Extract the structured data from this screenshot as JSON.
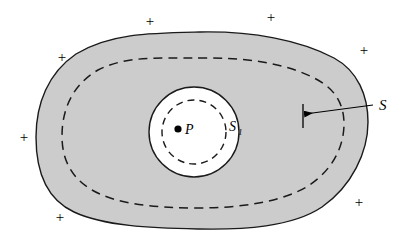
{
  "figure": {
    "background_color": "#ffffff",
    "shaded_fill": "#cccccc",
    "stroke_color": "#000000",
    "white_fill": "#ffffff"
  },
  "labels": {
    "outer_surface": "S",
    "inner_surface": "S",
    "inner_surface_subscript": "1",
    "point": "P"
  },
  "charges": {
    "symbol": "+",
    "positions": [
      {
        "x": 150,
        "y": 21
      },
      {
        "x": 271,
        "y": 17
      },
      {
        "x": 62,
        "y": 57
      },
      {
        "x": 364,
        "y": 50
      },
      {
        "x": 24,
        "y": 137
      },
      {
        "x": 60,
        "y": 217
      },
      {
        "x": 359,
        "y": 202
      }
    ]
  },
  "geometry": {
    "outer_blob_path": "M 200,32 C 252,31 300,40 334,58 C 358,71 368,96 368,122 C 368,152 352,186 322,207 C 292,227 244,230 198,229 C 150,228 104,226 74,212 C 46,199 36,170 36,137 C 36,104 48,73 76,54 C 110,33 152,33 200,32 Z",
    "inner_dashed_path": "M 198,58 C 244,57 286,63 316,79 C 337,90 344,106 344,124 C 344,146 333,170 308,186 C 282,202 240,208 198,208 C 154,208 116,204 92,190 C 70,177 62,158 62,136 C 62,110 72,85 98,70 C 126,56 156,58 198,58 Z",
    "white_disk": {
      "cx": 194,
      "cy": 132,
      "r": 45
    },
    "inner_dashed_circle": {
      "cx": 194,
      "cy": 132,
      "r": 32
    },
    "point_dot": {
      "cx": 178,
      "cy": 129,
      "r": 3.6
    },
    "leader_line": {
      "x1": 373,
      "y1": 105,
      "x2": 305,
      "y2": 114
    },
    "leader_tick": {
      "x": 303,
      "y1": 104,
      "y2": 128
    },
    "label_S_pos": {
      "x": 379,
      "y": 110
    },
    "label_P_pos": {
      "x": 185,
      "y": 134
    },
    "label_S1_pos": {
      "x": 229,
      "y": 131
    }
  }
}
